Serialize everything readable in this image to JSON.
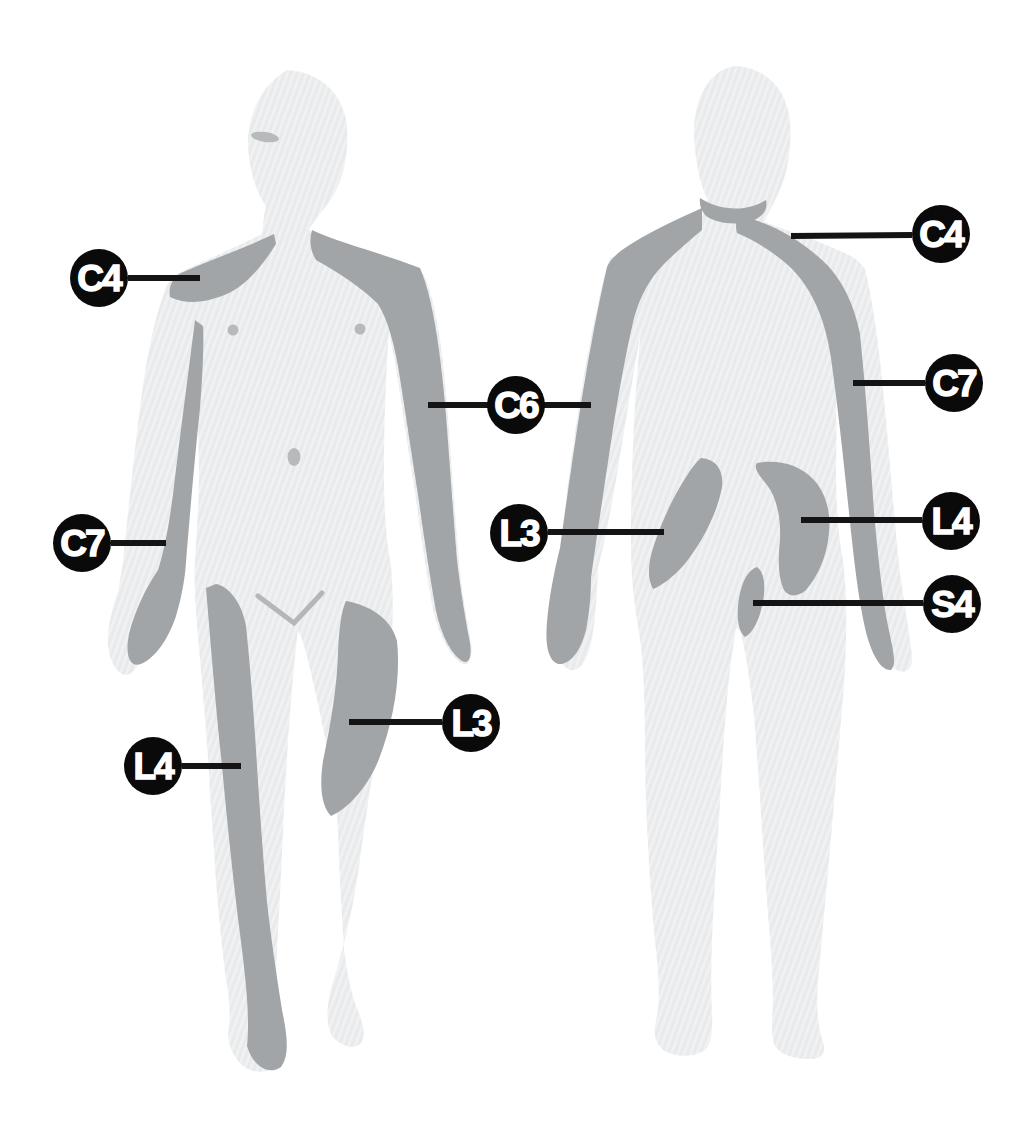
{
  "colors": {
    "background": "#ffffff",
    "body_silhouette": "#e8eaeb",
    "body_hatch_highlight": "#f1f2f3",
    "dermatome_region": "#a1a5a7",
    "badge_fill": "#0a0a0a",
    "badge_text": "#ffffff",
    "leader_line": "#141414"
  },
  "figures": {
    "front": {
      "annotations": {
        "c4": {
          "label": "C4"
        },
        "c7": {
          "label": "C7"
        },
        "l4": {
          "label": "L4"
        },
        "l3": {
          "label": "L3"
        }
      }
    },
    "shared": {
      "c6": {
        "label": "C6"
      }
    },
    "back": {
      "annotations": {
        "c4": {
          "label": "C4"
        },
        "c7": {
          "label": "C7"
        },
        "l4": {
          "label": "L4"
        },
        "s4": {
          "label": "S4"
        },
        "l3": {
          "label": "L3"
        }
      }
    }
  }
}
